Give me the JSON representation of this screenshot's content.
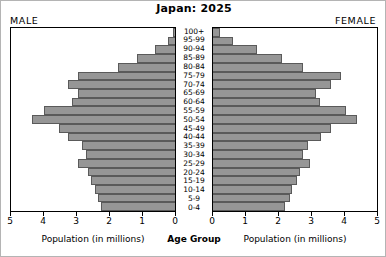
{
  "header": {
    "title": "Japan: 2025",
    "male_label": "MALE",
    "female_label": "FEMALE"
  },
  "axes": {
    "left_title": "Population (in millions)",
    "right_title": "Population (in millions)",
    "center_title": "Age Group",
    "left_ticks": [
      "5",
      "4",
      "3",
      "2",
      "1",
      "0"
    ],
    "right_ticks": [
      "0",
      "1",
      "2",
      "3",
      "4",
      "5"
    ]
  },
  "colors": {
    "bar_fill": "#969696",
    "bar_border": "#5a5a5a",
    "panel_border": "#000000",
    "background": "#ffffff"
  },
  "chart_data": {
    "type": "bar",
    "subtype": "population-pyramid",
    "title": "Japan: 2025",
    "xlabel": "Population (in millions)",
    "ylabel": "Age Group",
    "xlim": [
      0,
      5
    ],
    "grid": false,
    "legend": "none",
    "categories": [
      "100+",
      "95-99",
      "90-94",
      "85-89",
      "80-84",
      "75-79",
      "70-74",
      "65-69",
      "60-64",
      "55-59",
      "50-54",
      "45-49",
      "40-44",
      "35-39",
      "30-34",
      "25-29",
      "20-24",
      "15-19",
      "10-14",
      "5-9",
      "0-4"
    ],
    "series": [
      {
        "name": "MALE",
        "side": "left",
        "values": [
          0.05,
          0.22,
          0.62,
          1.15,
          1.75,
          2.95,
          3.25,
          2.95,
          3.15,
          4.0,
          4.35,
          3.55,
          3.25,
          2.85,
          2.7,
          2.95,
          2.65,
          2.55,
          2.45,
          2.35,
          2.25
        ]
      },
      {
        "name": "FEMALE",
        "side": "right",
        "values": [
          0.2,
          0.62,
          1.35,
          2.1,
          2.75,
          3.9,
          3.6,
          3.15,
          3.25,
          4.05,
          4.4,
          3.6,
          3.3,
          2.9,
          2.75,
          2.95,
          2.65,
          2.55,
          2.4,
          2.35,
          2.2
        ]
      }
    ]
  }
}
